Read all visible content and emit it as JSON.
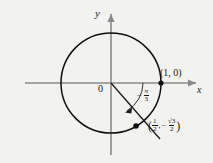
{
  "figure": {
    "kind": "unit-circle-diagram",
    "background_color": "#f2f2f0",
    "stroke_color": "#1a1a1a",
    "axis_color": "#8a8a8a"
  },
  "axes": {
    "x_label": "x",
    "y_label": "y",
    "origin_label": "0"
  },
  "circle": {
    "center_x": 111,
    "center_y": 83,
    "radius": 50
  },
  "angle": {
    "sign": "−",
    "numerator": "π",
    "denominator": "3",
    "value_radians": -1.0472,
    "label_text": "−π/3",
    "direction": "clockwise"
  },
  "points": [
    {
      "name": "point-one-zero",
      "label": "(1, 0)",
      "x": 1,
      "y": 0
    },
    {
      "name": "point-terminal",
      "label": "(1/2, −√3/2)",
      "x_num": "1",
      "x_den": "2",
      "y_sign": "−",
      "y_num": "√3",
      "y_den": "2"
    }
  ],
  "coord_label": {
    "open_paren": "(",
    "close_paren": ")",
    "comma": ",",
    "minus": "−",
    "x_num": "1",
    "x_den": "2",
    "y_num": "√3",
    "y_den": "2"
  }
}
